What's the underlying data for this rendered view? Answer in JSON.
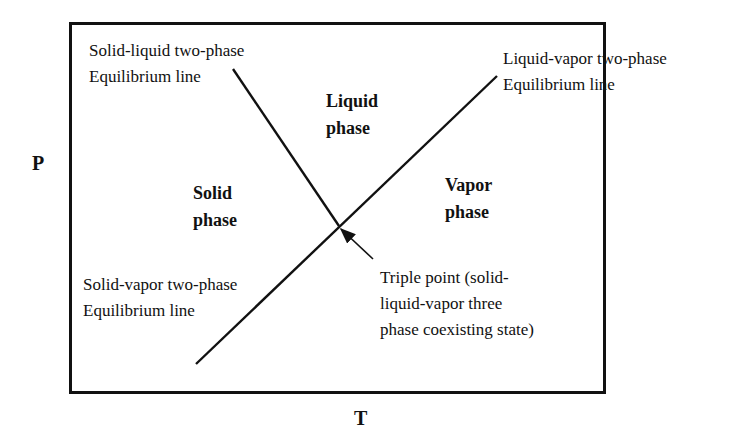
{
  "axes": {
    "y_label": "P",
    "x_label": "T"
  },
  "regions": {
    "liquid": [
      "Liquid",
      "phase"
    ],
    "solid": [
      "Solid",
      "phase"
    ],
    "vapor": [
      "Vapor",
      "phase"
    ]
  },
  "annotations": {
    "solid_liquid": [
      "Solid-liquid two-phase",
      "Equilibrium line"
    ],
    "liquid_vapor": [
      "Liquid-vapor two-phase",
      "Equilibrium line"
    ],
    "solid_vapor": [
      "Solid-vapor two-phase",
      "Equilibrium line"
    ],
    "triple_point": [
      "Triple point (solid-",
      "liquid-vapor three",
      "phase coexisting state)"
    ]
  },
  "colors": {
    "line": "#111111",
    "background": "#ffffff"
  }
}
